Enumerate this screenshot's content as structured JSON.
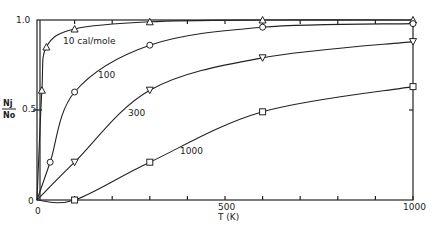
{
  "chart_data": {
    "type": "line",
    "title": "",
    "xlabel": "T (K)",
    "ylabel_numerator": "Nj",
    "ylabel_denominator": "No",
    "ylabel": "Nj/No",
    "xlim": [
      0,
      1000
    ],
    "ylim": [
      0,
      1.0
    ],
    "x_tick_labels": [
      "0",
      "500",
      "1000"
    ],
    "x_minor_ticks": [
      100,
      200,
      300,
      400,
      500,
      600,
      700,
      800,
      900,
      1000
    ],
    "y_tick_labels": [
      "0",
      "0.5",
      "1.0"
    ],
    "grid": false,
    "legend": "inline curve labels",
    "series": [
      {
        "name": "10 cal/mole",
        "label": "10 cal/mole",
        "marker": "triangle-up",
        "x": [
          0,
          13,
          25,
          100,
          300,
          600,
          1000
        ],
        "values": [
          0,
          0.61,
          0.85,
          0.95,
          0.99,
          1.0,
          1.0
        ]
      },
      {
        "name": "100",
        "label": "100",
        "marker": "circle",
        "x": [
          0,
          35,
          100,
          300,
          600,
          1000
        ],
        "values": [
          0,
          0.21,
          0.6,
          0.86,
          0.96,
          0.98
        ]
      },
      {
        "name": "300",
        "label": "300",
        "marker": "triangle-down",
        "x": [
          0,
          100,
          300,
          600,
          1000
        ],
        "values": [
          0,
          0.21,
          0.61,
          0.79,
          0.88
        ]
      },
      {
        "name": "1000",
        "label": "1000",
        "marker": "square",
        "x": [
          0,
          100,
          300,
          600,
          1000
        ],
        "values": [
          0,
          0.0,
          0.21,
          0.49,
          0.63
        ]
      }
    ]
  },
  "labels": {
    "y_top": "1.0",
    "y_mid": "0.5",
    "y_zero": "0",
    "x_zero": "0",
    "x_mid": "500",
    "x_max": "1000",
    "x_axis_title": "T (K)",
    "y_num": "Nj",
    "y_den": "No",
    "curve_10": "10 cal/mole",
    "curve_100": "100",
    "curve_300": "300",
    "curve_1000": "1000"
  }
}
